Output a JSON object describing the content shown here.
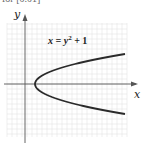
{
  "top_text": "for [0.01]",
  "chart_data": {
    "type": "line",
    "title": "",
    "annotation": "x = y² + 1",
    "xlabel": "x",
    "ylabel": "y",
    "grid": true,
    "xlim": [
      -2,
      10
    ],
    "ylim": [
      -5,
      6
    ],
    "series": [
      {
        "name": "x = y^2 + 1",
        "x": [
          10,
          7.25,
          5,
          3.25,
          2,
          1.25,
          1,
          1.25,
          2,
          3.25,
          5,
          7.25,
          10
        ],
        "y": [
          3,
          2.5,
          2,
          1.5,
          1,
          0.5,
          0,
          -0.5,
          -1,
          -1.5,
          -2,
          -2.5,
          -3
        ]
      }
    ]
  },
  "labels": {
    "x_axis": "x",
    "y_axis": "y",
    "eq_main": "x = y",
    "eq_sup": "2",
    "eq_tail": " + 1"
  }
}
